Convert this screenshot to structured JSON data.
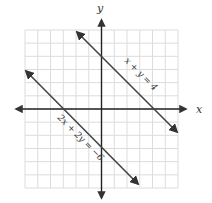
{
  "figure": {
    "type": "coordinate-plane",
    "grid": {
      "xmin": -6,
      "xmax": 6,
      "ymin": -6,
      "ymax": 6,
      "step": 1
    },
    "axes": {
      "x_label": "x",
      "y_label": "y"
    },
    "lines": [
      {
        "label": "x + y = 4",
        "slope": -1,
        "y_intercept": 4,
        "x_intercept": 4
      },
      {
        "label": "2x + 2y = −6",
        "slope": -1,
        "y_intercept": -3,
        "x_intercept": -3
      }
    ]
  },
  "colors": {
    "grid": "#d9d9d9",
    "axis": "#222222",
    "line": "#444444"
  }
}
